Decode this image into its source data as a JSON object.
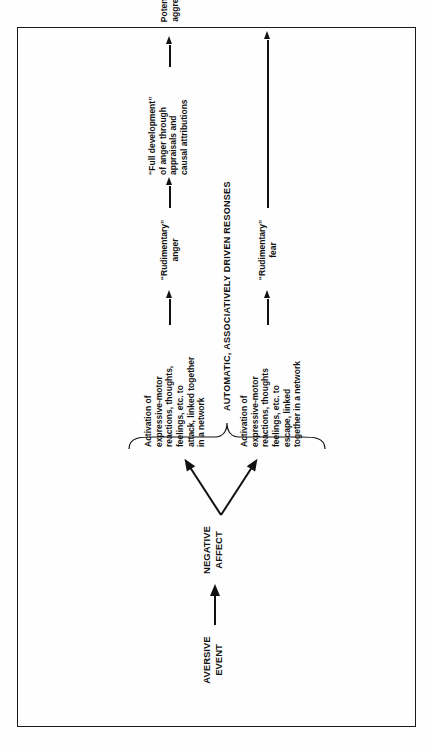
{
  "figure": {
    "orientation": "rotated-90-ccw",
    "ink_color": "#111111",
    "background_color": "#fefefe",
    "nodes": {
      "aversive_event": "AVERSIVE\nEVENT",
      "negative_affect": "NEGATIVE\nAFFECT",
      "anger_network": "Activation of\nexpressive-motor\nreactions, thoughts,\nfeelings, etc. to\nattack, linked together\nin a network",
      "fear_network": "Activation of\nexpressive-motor\nreactions, thoughts\nfeelings, etc. to\nescape, linked\ntogether in a network",
      "rudimentary_anger": "“Rudimentary”\nanger",
      "rudimentary_fear": "“Rudimentary”\nfear",
      "full_development": "“Full development”\nof anger through\nappraisals and\ncausal attributions",
      "potential_aggression": "Potential to\naggression"
    },
    "caption": "AUTOMATIC, ASSOCIATIVELY DRIVEN RESONSES"
  }
}
